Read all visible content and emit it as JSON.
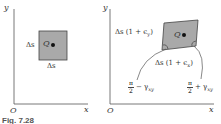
{
  "figure": {
    "caption": "Fig. 7.28",
    "left_panel": {
      "axis_y_label": "y",
      "axis_x_label": "x",
      "origin_label": "O",
      "point_label": "Q",
      "side_left_label": "Δs",
      "side_bottom_label": "Δs",
      "fill_color": "#a9a9a9"
    },
    "right_panel": {
      "axis_y_label": "y",
      "axis_x_label": "x",
      "origin_label": "O",
      "point_label": "Q",
      "side_left_label": "Δs (1 + ϵ",
      "side_left_sub": "y",
      "side_bottom_label": "Δs (1 + ϵ",
      "side_bottom_sub": "x",
      "angle_left_num": "π",
      "angle_left_den": "2",
      "angle_left_rest": "− γ",
      "angle_left_sub": "xy",
      "angle_right_num": "π",
      "angle_right_den": "2",
      "angle_right_rest": "+ γ",
      "angle_right_sub": "xy",
      "fill_color": "#a9a9a9"
    }
  }
}
